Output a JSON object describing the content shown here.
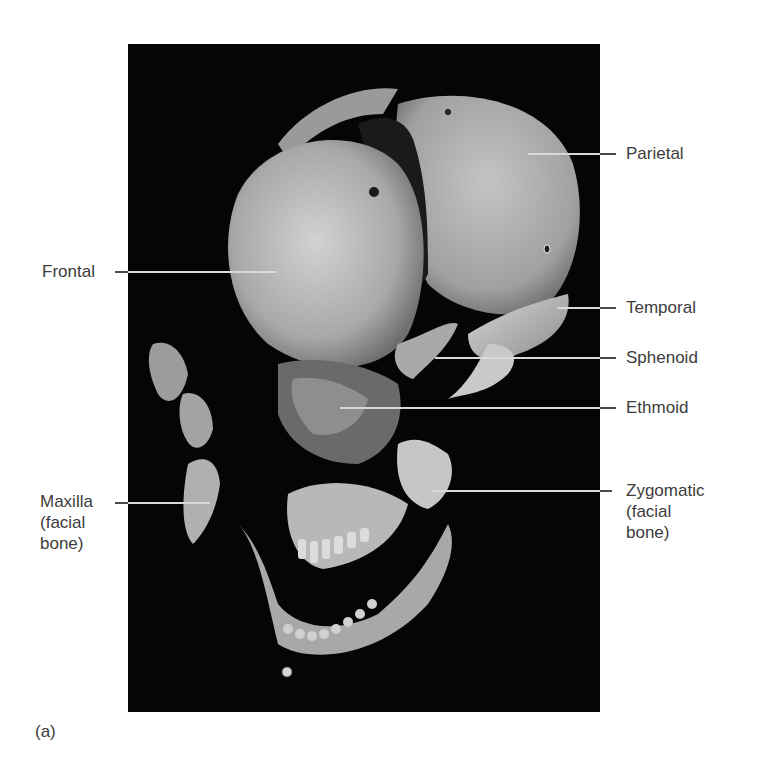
{
  "figure": {
    "panel_label": "(a)",
    "labels": {
      "frontal": "Frontal",
      "parietal": "Parietal",
      "temporal": "Temporal",
      "sphenoid": "Sphenoid",
      "ethmoid": "Ethmoid",
      "maxilla": "Maxilla\n(facial\nbone)",
      "zygomatic": "Zygomatic\n(facial\nbone)"
    },
    "colors": {
      "background": "#ffffff",
      "photo_background": "#050505",
      "bone": "#bdbdbd",
      "label_text": "#3c3c3c",
      "leader_line": "#d9d9d9"
    }
  }
}
